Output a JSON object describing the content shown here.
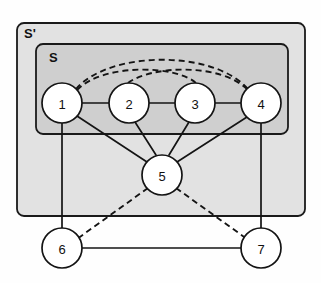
{
  "figure": {
    "type": "graph-diagram",
    "background_color": "#fefefe",
    "title": ""
  },
  "regions": [
    {
      "id": "S-prime",
      "label": "S'",
      "label_x": 24,
      "label_y": 38,
      "x": 17,
      "y": 23,
      "width": 288,
      "height": 193,
      "rx": 7,
      "fill": "#e2e2e2",
      "stroke": "#1a1a1a"
    },
    {
      "id": "S",
      "label": "S",
      "label_x": 49,
      "label_y": 62,
      "x": 36,
      "y": 44,
      "width": 252,
      "height": 90,
      "rx": 7,
      "fill": "#cfcfcf",
      "stroke": "#1a1a1a"
    }
  ],
  "nodes": [
    {
      "id": "n1",
      "label": "1",
      "cx": 62,
      "cy": 103,
      "r": 20,
      "region": "S"
    },
    {
      "id": "n2",
      "label": "2",
      "cx": 129,
      "cy": 103,
      "r": 20,
      "region": "S"
    },
    {
      "id": "n3",
      "label": "3",
      "cx": 195,
      "cy": 103,
      "r": 20,
      "region": "S"
    },
    {
      "id": "n4",
      "label": "4",
      "cx": 261,
      "cy": 103,
      "r": 20,
      "region": "S"
    },
    {
      "id": "n5",
      "label": "5",
      "cx": 162,
      "cy": 175,
      "r": 20,
      "region": "S-prime"
    },
    {
      "id": "n6",
      "label": "6",
      "cx": 62,
      "cy": 248,
      "r": 20,
      "region": "outside"
    },
    {
      "id": "n7",
      "label": "7",
      "cx": 261,
      "cy": 248,
      "r": 20,
      "region": "outside"
    }
  ],
  "edges_solid": [
    {
      "id": "e1-2",
      "from": "n1",
      "to": "n2",
      "x1": 82,
      "y1": 103,
      "x2": 109,
      "y2": 103
    },
    {
      "id": "e2-3",
      "from": "n2",
      "to": "n3",
      "x1": 149,
      "y1": 103,
      "x2": 175,
      "y2": 103
    },
    {
      "id": "e3-4",
      "from": "n3",
      "to": "n4",
      "x1": 215,
      "y1": 103,
      "x2": 241,
      "y2": 103
    },
    {
      "id": "e1-5",
      "from": "n1",
      "to": "n5",
      "x1": 77,
      "y1": 116,
      "x2": 147,
      "y2": 162
    },
    {
      "id": "e2-5",
      "from": "n2",
      "to": "n5",
      "x1": 135,
      "y1": 122,
      "x2": 156,
      "y2": 155
    },
    {
      "id": "e3-5",
      "from": "n3",
      "to": "n5",
      "x1": 189,
      "y1": 122,
      "x2": 169,
      "y2": 155
    },
    {
      "id": "e4-5",
      "from": "n4",
      "to": "n5",
      "x1": 247,
      "y1": 117,
      "x2": 177,
      "y2": 162
    },
    {
      "id": "e1-6",
      "from": "n1",
      "to": "n6",
      "x1": 62,
      "y1": 123,
      "x2": 62,
      "y2": 228
    },
    {
      "id": "e4-7",
      "from": "n4",
      "to": "n7",
      "x1": 261,
      "y1": 123,
      "x2": 261,
      "y2": 228
    },
    {
      "id": "e6-7",
      "from": "n6",
      "to": "n7",
      "x1": 82,
      "y1": 248,
      "x2": 241,
      "y2": 248
    }
  ],
  "edges_dashed": [
    {
      "id": "e1-4-arc",
      "from": "n1",
      "to": "n4",
      "path": "M 76 89 C 110 50, 214 50, 248 89",
      "style": "dashed-arc"
    },
    {
      "id": "e1-3-arc",
      "from": "n1",
      "to": "n3",
      "path": "M 77 90 C 105 62, 178 66, 196 83",
      "style": "dashed-arc"
    },
    {
      "id": "e2-4-arc",
      "from": "n2",
      "to": "n4",
      "path": "M 128 83, C 150 66, 220 62, 248 90",
      "style": "dashed-arc"
    },
    {
      "id": "e5-6-dash",
      "from": "n5",
      "to": "n6",
      "path": "M 148 188 L 77 239",
      "style": "dashed-line"
    },
    {
      "id": "e5-7-dash",
      "from": "n5",
      "to": "n7",
      "path": "M 176 188 L 247 239",
      "style": "dashed-line"
    }
  ],
  "colors": {
    "outer_region_fill": "#e2e2e2",
    "inner_region_fill": "#cfcfcf",
    "node_fill": "#ffffff",
    "stroke": "#141414"
  }
}
